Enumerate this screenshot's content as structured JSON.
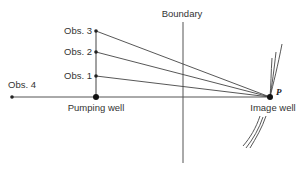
{
  "diagram": {
    "boundary_label": "Boundary",
    "pumping_well_label": "Pumping well",
    "image_well_label": "Image well",
    "point_label": "P",
    "observation_wells": [
      {
        "label": "Obs. 1"
      },
      {
        "label": "Obs. 2"
      },
      {
        "label": "Obs. 3"
      },
      {
        "label": "Obs. 4"
      }
    ]
  },
  "colors": {
    "line": "#444444",
    "text": "#333333",
    "background": "#ffffff"
  }
}
